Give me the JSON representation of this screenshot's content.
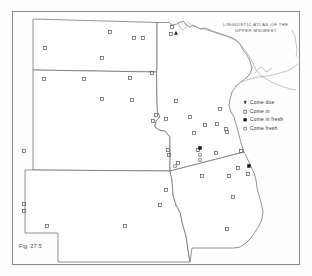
{
  "figure": {
    "label": "Fig. 27.5",
    "atlas_title_line1": "LINGUISTIC ATLAS OF THE",
    "atlas_title_line2": "UPPER MIDWEST"
  },
  "legend": {
    "items": [
      {
        "symbol": "filled-triangle",
        "label": "Come due"
      },
      {
        "symbol": "open-square",
        "label": "Come in"
      },
      {
        "symbol": "filled-square",
        "label": "Come in fresh"
      },
      {
        "symbol": "open-square-small",
        "label": "Come fresh"
      }
    ]
  },
  "chart_data": {
    "type": "scatter",
    "title": "LINGUISTIC ATLAS OF THE UPPER MIDWEST",
    "subtitle": "Fig. 27.5",
    "xlabel": "",
    "ylabel": "",
    "grid": false,
    "legend_position": "right",
    "projection": "geographic-upper-midwest",
    "region_states": [
      "North Dakota",
      "South Dakota",
      "Nebraska",
      "Minnesota",
      "Iowa"
    ],
    "series": [
      {
        "name": "Come due",
        "symbol": "filled-triangle",
        "color": "#1a1a1a",
        "points": [
          {
            "x": 176,
            "y": 33
          }
        ]
      },
      {
        "name": "Come in",
        "symbol": "open-square",
        "color": "#555555",
        "points": [
          {
            "x": 110,
            "y": 32
          },
          {
            "x": 134,
            "y": 38
          },
          {
            "x": 143,
            "y": 38
          },
          {
            "x": 172,
            "y": 27
          },
          {
            "x": 171,
            "y": 34
          },
          {
            "x": 45,
            "y": 48
          },
          {
            "x": 102,
            "y": 58
          },
          {
            "x": 152,
            "y": 73
          },
          {
            "x": 44,
            "y": 79
          },
          {
            "x": 84,
            "y": 79
          },
          {
            "x": 130,
            "y": 78
          },
          {
            "x": 102,
            "y": 99
          },
          {
            "x": 132,
            "y": 100
          },
          {
            "x": 156,
            "y": 115
          },
          {
            "x": 153,
            "y": 121
          },
          {
            "x": 166,
            "y": 119
          },
          {
            "x": 176,
            "y": 101
          },
          {
            "x": 190,
            "y": 117
          },
          {
            "x": 220,
            "y": 109
          },
          {
            "x": 205,
            "y": 125
          },
          {
            "x": 217,
            "y": 124
          },
          {
            "x": 226,
            "y": 129
          },
          {
            "x": 227,
            "y": 132
          },
          {
            "x": 194,
            "y": 133
          },
          {
            "x": 168,
            "y": 150
          },
          {
            "x": 169,
            "y": 155
          },
          {
            "x": 198,
            "y": 150
          },
          {
            "x": 216,
            "y": 153
          },
          {
            "x": 241,
            "y": 151
          },
          {
            "x": 178,
            "y": 163
          },
          {
            "x": 24,
            "y": 151
          },
          {
            "x": 238,
            "y": 168
          },
          {
            "x": 202,
            "y": 176
          },
          {
            "x": 229,
            "y": 176
          },
          {
            "x": 248,
            "y": 174
          },
          {
            "x": 166,
            "y": 190
          },
          {
            "x": 160,
            "y": 205
          },
          {
            "x": 24,
            "y": 204
          },
          {
            "x": 24,
            "y": 211
          },
          {
            "x": 47,
            "y": 226
          },
          {
            "x": 125,
            "y": 226
          },
          {
            "x": 233,
            "y": 197
          },
          {
            "x": 227,
            "y": 229
          }
        ]
      },
      {
        "name": "Come in fresh",
        "symbol": "filled-square",
        "color": "#1a1a1a",
        "points": [
          {
            "x": 200,
            "y": 148
          },
          {
            "x": 249,
            "y": 166
          }
        ]
      },
      {
        "name": "Come fresh",
        "symbol": "open-square-small",
        "color": "#6a6a6a",
        "points": [
          {
            "x": 200,
            "y": 155
          },
          {
            "x": 200,
            "y": 160
          },
          {
            "x": 175,
            "y": 166
          }
        ]
      }
    ]
  }
}
